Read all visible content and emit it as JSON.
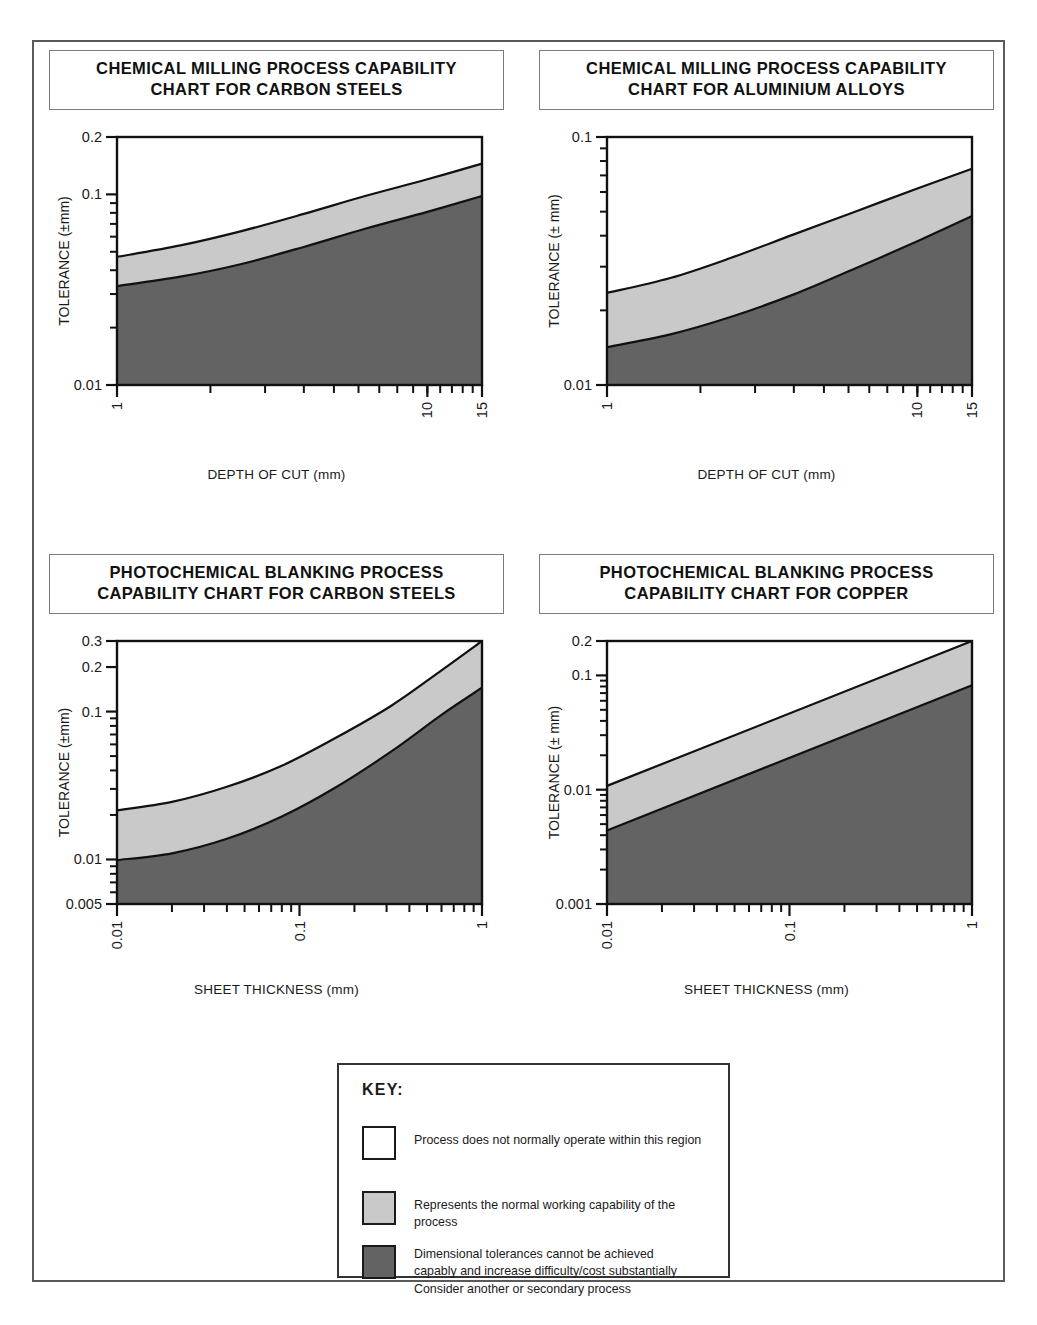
{
  "page": {
    "background": "#ffffff",
    "frame_border_color": "#5a5a5a"
  },
  "colors": {
    "white_region": "#ffffff",
    "light_gray_region": "#c9c9c9",
    "dark_gray_region": "#636363",
    "line": "#111111",
    "text": "#1a1a1a"
  },
  "key": {
    "title": "KEY:",
    "items": [
      {
        "swatch": "#ffffff",
        "swatch_name": "white-swatch",
        "lines": [
          "Process does not normally operate within this region"
        ]
      },
      {
        "swatch": "#c9c9c9",
        "swatch_name": "light-gray-swatch",
        "lines": [
          "Represents the normal working capability of the",
          "process"
        ]
      },
      {
        "swatch": "#636363",
        "swatch_name": "dark-gray-swatch",
        "lines": [
          "Dimensional tolerances cannot be achieved",
          "capably and increase difficulty/cost substantially",
          "Consider another or secondary process"
        ]
      }
    ]
  },
  "chart_data": [
    {
      "id": "chemical-milling-carbon-steels",
      "type": "area",
      "title_lines": [
        "CHEMICAL MILLING PROCESS CAPABILITY",
        "CHART FOR CARBON STEELS"
      ],
      "xlabel": "DEPTH OF CUT  (mm)",
      "ylabel": "TOLERANCE (±mm)",
      "xscale": "log",
      "yscale": "log",
      "xlim": [
        1,
        15
      ],
      "ylim": [
        0.01,
        0.2
      ],
      "x_ticklabels": [
        {
          "value": 1,
          "label": "1"
        },
        {
          "value": 10,
          "label": "10"
        },
        {
          "value": 15,
          "label": "15"
        }
      ],
      "x_minor_ticks": [
        2,
        3,
        4,
        5,
        6,
        7,
        8,
        9,
        10,
        11,
        12,
        13,
        14,
        15
      ],
      "y_ticklabels": [
        {
          "value": 0.2,
          "label": "0.2"
        },
        {
          "value": 0.1,
          "label": "0.1"
        },
        {
          "value": 0.01,
          "label": "0.01"
        }
      ],
      "y_minor_ticks": [
        0.02,
        0.03,
        0.04,
        0.05,
        0.06,
        0.07,
        0.08,
        0.09
      ],
      "grid": false,
      "legend": "external-key",
      "boundaries": {
        "upper": {
          "name": "normal-capability-upper-boundary",
          "x": [
            1,
            1.6,
            2.5,
            4,
            6.3,
            10,
            15
          ],
          "y": [
            0.047,
            0.054,
            0.064,
            0.079,
            0.098,
            0.12,
            0.145
          ]
        },
        "lower": {
          "name": "normal-capability-lower-boundary",
          "x": [
            1,
            1.6,
            2.5,
            4,
            6.3,
            10,
            15
          ],
          "y": [
            0.033,
            0.037,
            0.043,
            0.053,
            0.066,
            0.081,
            0.098
          ]
        }
      }
    },
    {
      "id": "chemical-milling-aluminium-alloys",
      "type": "area",
      "title_lines": [
        "CHEMICAL MILLING PROCESS CAPABILITY",
        "CHART FOR ALUMINIUM ALLOYS"
      ],
      "xlabel": "DEPTH OF CUT  (mm)",
      "ylabel": "TOLERANCE (± mm)",
      "xscale": "log",
      "yscale": "log",
      "xlim": [
        1,
        15
      ],
      "ylim": [
        0.01,
        0.1
      ],
      "x_ticklabels": [
        {
          "value": 1,
          "label": "1"
        },
        {
          "value": 10,
          "label": "10"
        },
        {
          "value": 15,
          "label": "15"
        }
      ],
      "x_minor_ticks": [
        2,
        3,
        4,
        5,
        6,
        7,
        8,
        9,
        10,
        11,
        12,
        13,
        14,
        15
      ],
      "y_ticklabels": [
        {
          "value": 0.1,
          "label": "0.1"
        },
        {
          "value": 0.01,
          "label": "0.01"
        }
      ],
      "y_minor_ticks": [
        0.02,
        0.03,
        0.04,
        0.05,
        0.06,
        0.07,
        0.08,
        0.09
      ],
      "grid": false,
      "legend": "external-key",
      "boundaries": {
        "upper": {
          "name": "normal-capability-upper-boundary",
          "x": [
            1,
            1.6,
            2.5,
            4,
            6.3,
            10,
            15
          ],
          "y": [
            0.0235,
            0.027,
            0.0325,
            0.0405,
            0.05,
            0.062,
            0.0745
          ]
        },
        "lower": {
          "name": "normal-capability-lower-boundary",
          "x": [
            1,
            1.6,
            2.5,
            4,
            6.3,
            10,
            15
          ],
          "y": [
            0.0142,
            0.016,
            0.0188,
            0.0232,
            0.0295,
            0.038,
            0.048
          ]
        }
      }
    },
    {
      "id": "photochemical-blanking-carbon-steels",
      "type": "area",
      "title_lines": [
        "PHOTOCHEMICAL BLANKING PROCESS",
        "CAPABILITY CHART FOR CARBON STEELS"
      ],
      "xlabel": "SHEET THICKNESS (mm)",
      "ylabel": "TOLERANCE (±mm)",
      "xscale": "log",
      "yscale": "log",
      "xlim": [
        0.01,
        1
      ],
      "ylim": [
        0.005,
        0.3
      ],
      "x_ticklabels": [
        {
          "value": 0.01,
          "label": "0.01"
        },
        {
          "value": 0.1,
          "label": "0.1"
        },
        {
          "value": 1,
          "label": "1"
        }
      ],
      "x_minor_ticks": [
        0.02,
        0.03,
        0.04,
        0.05,
        0.06,
        0.07,
        0.08,
        0.09,
        0.2,
        0.3,
        0.4,
        0.5,
        0.6,
        0.7,
        0.8,
        0.9
      ],
      "y_ticklabels": [
        {
          "value": 0.3,
          "label": "0.3"
        },
        {
          "value": 0.2,
          "label": "0.2"
        },
        {
          "value": 0.1,
          "label": "0.1"
        },
        {
          "value": 0.01,
          "label": "0.01"
        },
        {
          "value": 0.005,
          "label": "0.005"
        }
      ],
      "y_minor_ticks": [
        0.006,
        0.007,
        0.008,
        0.009,
        0.02,
        0.03,
        0.04,
        0.05,
        0.06,
        0.07,
        0.08,
        0.09
      ],
      "grid": false,
      "legend": "external-key",
      "boundaries": {
        "upper": {
          "name": "normal-capability-upper-boundary",
          "x": [
            0.01,
            0.02,
            0.04,
            0.08,
            0.16,
            0.32,
            0.6,
            1
          ],
          "y": [
            0.0215,
            0.0245,
            0.031,
            0.043,
            0.067,
            0.11,
            0.19,
            0.3
          ]
        },
        "lower": {
          "name": "normal-capability-lower-boundary",
          "x": [
            0.01,
            0.02,
            0.04,
            0.08,
            0.16,
            0.32,
            0.6,
            1
          ],
          "y": [
            0.0099,
            0.011,
            0.0138,
            0.0195,
            0.031,
            0.054,
            0.095,
            0.145
          ]
        }
      }
    },
    {
      "id": "photochemical-blanking-copper",
      "type": "area",
      "title_lines": [
        "PHOTOCHEMICAL BLANKING PROCESS",
        "CAPABILITY CHART FOR COPPER"
      ],
      "xlabel": "SHEET THICKNESS (mm)",
      "ylabel": "TOLERANCE (± mm)",
      "xscale": "log",
      "yscale": "log",
      "xlim": [
        0.01,
        1
      ],
      "ylim": [
        0.001,
        0.2
      ],
      "x_ticklabels": [
        {
          "value": 0.01,
          "label": "0.01"
        },
        {
          "value": 0.1,
          "label": "0.1"
        },
        {
          "value": 1,
          "label": "1"
        }
      ],
      "x_minor_ticks": [
        0.02,
        0.03,
        0.04,
        0.05,
        0.06,
        0.07,
        0.08,
        0.09,
        0.2,
        0.3,
        0.4,
        0.5,
        0.6,
        0.7,
        0.8,
        0.9
      ],
      "y_ticklabels": [
        {
          "value": 0.2,
          "label": "0.2"
        },
        {
          "value": 0.1,
          "label": "0.1"
        },
        {
          "value": 0.01,
          "label": "0.01"
        },
        {
          "value": 0.001,
          "label": "0.001"
        }
      ],
      "y_minor_ticks": [
        0.002,
        0.003,
        0.004,
        0.005,
        0.006,
        0.007,
        0.008,
        0.009,
        0.02,
        0.03,
        0.04,
        0.05,
        0.06,
        0.07,
        0.08,
        0.09
      ],
      "grid": false,
      "legend": "external-key",
      "boundaries": {
        "upper": {
          "name": "normal-capability-upper-boundary",
          "x": [
            0.01,
            1
          ],
          "y": [
            0.0108,
            0.2
          ]
        },
        "lower": {
          "name": "normal-capability-lower-boundary",
          "x": [
            0.01,
            1
          ],
          "y": [
            0.0044,
            0.082
          ]
        }
      }
    }
  ]
}
